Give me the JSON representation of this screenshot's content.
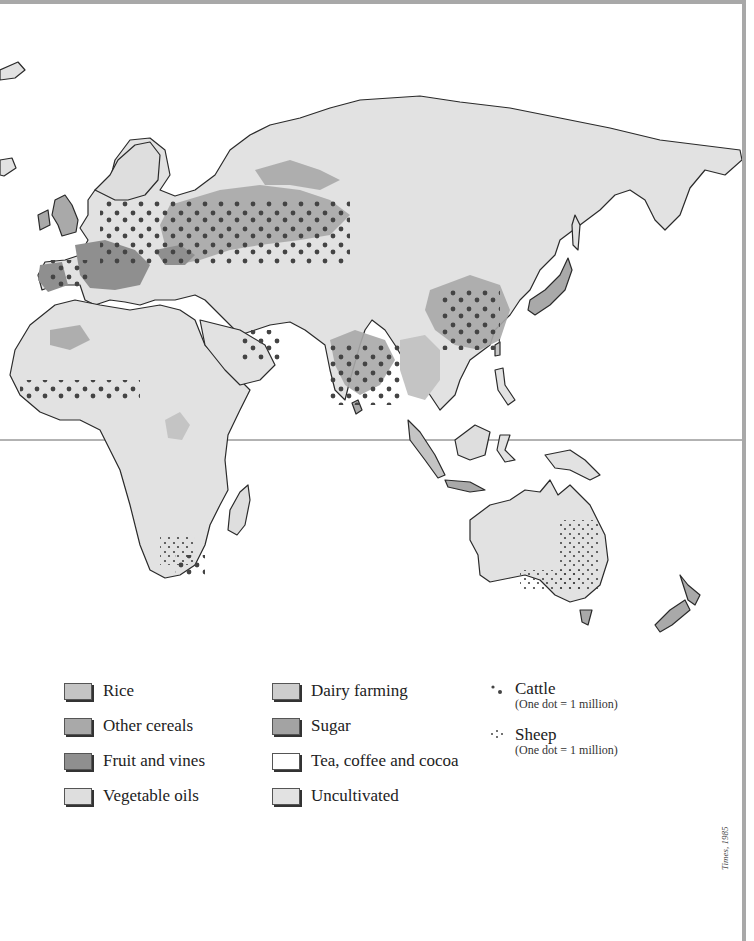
{
  "map": {
    "title": "World agricultural land use (Eastern Hemisphere)",
    "equator_line": true,
    "colors": {
      "ocean": "#ffffff",
      "land_uncultivated": "#e2e2e2",
      "rice": "#c4c4c4",
      "other_cereals": "#a9a9a9",
      "fruit_and_vines": "#8f8f8f",
      "vegetable_oils": "#dedede",
      "dairy_farming": "#cdcdcd",
      "sugar": "#a3a3a3",
      "tea_coffee_cocoa": "#ffffff",
      "coastline": "#2a2a2a",
      "border": "#555555",
      "dot": "#444444"
    }
  },
  "legend": {
    "land_use": [
      {
        "label": "Rice",
        "color": "#c4c4c4"
      },
      {
        "label": "Other cereals",
        "color": "#a9a9a9"
      },
      {
        "label": "Fruit and vines",
        "color": "#8f8f8f"
      },
      {
        "label": "Vegetable oils",
        "color": "#dedede"
      },
      {
        "label": "Dairy farming",
        "color": "#cdcdcd"
      },
      {
        "label": "Sugar",
        "color": "#a3a3a3"
      },
      {
        "label": "Tea, coffee and cocoa",
        "color": "#ffffff"
      },
      {
        "label": "Uncultivated",
        "color": "#e2e2e2"
      }
    ],
    "livestock": [
      {
        "label": "Cattle",
        "note": "(One dot = 1 million)",
        "symbol": "large-dot"
      },
      {
        "label": "Sheep",
        "note": "(One dot = 1 million)",
        "symbol": "small-dot"
      }
    ]
  },
  "source_credit": "Times, 1985"
}
